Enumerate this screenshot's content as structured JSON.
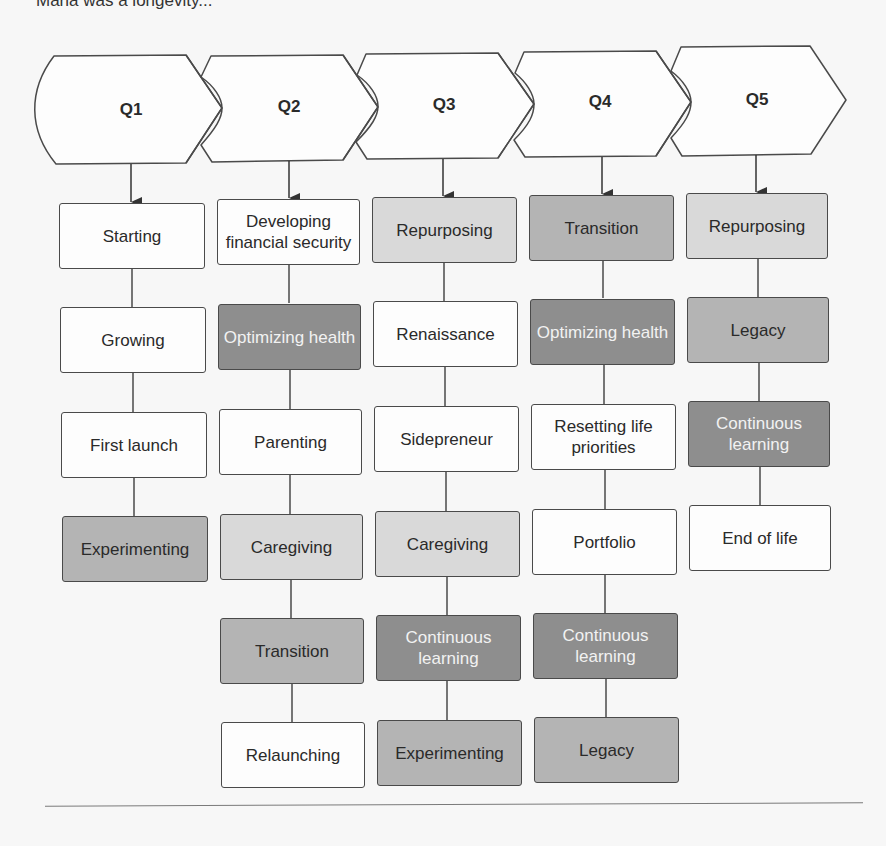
{
  "caption": "Maria was a longevity...",
  "colors": {
    "white": "#fdfdfd",
    "light": "#d9d9d9",
    "medium": "#b4b4b4",
    "dark": "#8e8e8e",
    "stroke": "#4a4a4a"
  },
  "columns": [
    {
      "header": "Q1",
      "stages": [
        {
          "label": "Starting",
          "shade": "white"
        },
        {
          "label": "Growing",
          "shade": "white"
        },
        {
          "label": "First launch",
          "shade": "white"
        },
        {
          "label": "Experimenting",
          "shade": "medium"
        }
      ]
    },
    {
      "header": "Q2",
      "stages": [
        {
          "label": "Developing financial security",
          "shade": "white"
        },
        {
          "label": "Optimizing health",
          "shade": "dark"
        },
        {
          "label": "Parenting",
          "shade": "white"
        },
        {
          "label": "Caregiving",
          "shade": "light"
        },
        {
          "label": "Transition",
          "shade": "medium"
        },
        {
          "label": "Relaunching",
          "shade": "white"
        }
      ]
    },
    {
      "header": "Q3",
      "stages": [
        {
          "label": "Repurposing",
          "shade": "light"
        },
        {
          "label": "Renaissance",
          "shade": "white"
        },
        {
          "label": "Sidepreneur",
          "shade": "white"
        },
        {
          "label": "Caregiving",
          "shade": "light"
        },
        {
          "label": "Continuous learning",
          "shade": "dark"
        },
        {
          "label": "Experimenting",
          "shade": "medium"
        }
      ]
    },
    {
      "header": "Q4",
      "stages": [
        {
          "label": "Transition",
          "shade": "medium"
        },
        {
          "label": "Optimizing health",
          "shade": "dark"
        },
        {
          "label": "Resetting life priorities",
          "shade": "white"
        },
        {
          "label": "Portfolio",
          "shade": "white"
        },
        {
          "label": "Continuous learning",
          "shade": "dark"
        },
        {
          "label": "Legacy",
          "shade": "medium"
        }
      ]
    },
    {
      "header": "Q5",
      "stages": [
        {
          "label": "Repurposing",
          "shade": "light"
        },
        {
          "label": "Legacy",
          "shade": "medium"
        },
        {
          "label": "Continuous learning",
          "shade": "dark"
        },
        {
          "label": "End of life",
          "shade": "white"
        }
      ]
    }
  ]
}
